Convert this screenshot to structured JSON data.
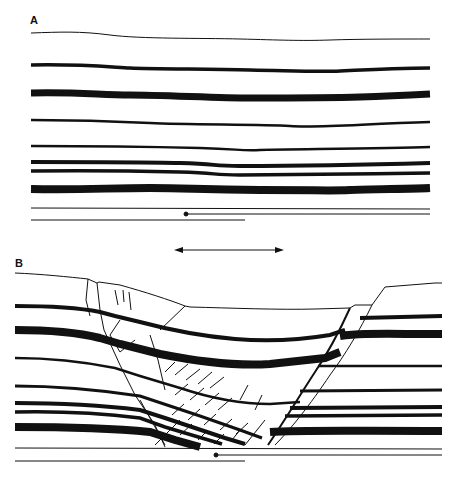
{
  "figure": {
    "panels": [
      {
        "label": "A",
        "description": "Undeformed layered strata before extension"
      },
      {
        "label": "B",
        "description": "Extended strata with graben / normal fault zone"
      }
    ],
    "extension_arrow": {
      "direction": "bidirectional-horizontal"
    },
    "colors": {
      "ink": "#111111",
      "background": "#ffffff"
    }
  }
}
